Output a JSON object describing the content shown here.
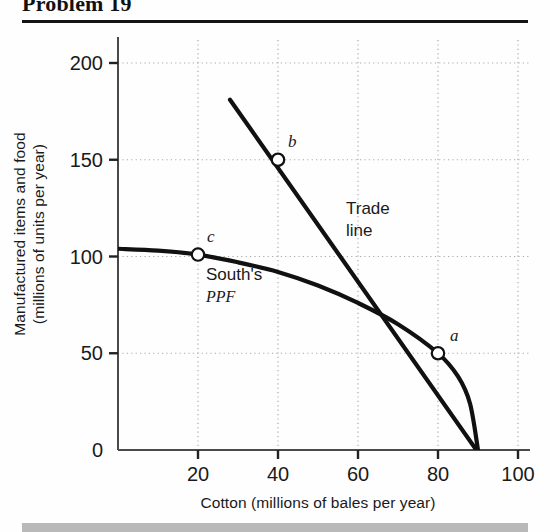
{
  "header": {
    "title": "Problem 19"
  },
  "chart_data": {
    "type": "line",
    "title": "Problem 19",
    "xlabel": "Cotton (millions of bales per year)",
    "ylabel_line1": "Manufactured items and food",
    "ylabel_line2": "(millions of units per year)",
    "xlim": [
      0,
      105
    ],
    "ylim": [
      0,
      215
    ],
    "xticks": [
      0,
      20,
      40,
      60,
      80,
      100
    ],
    "xtick_labels": [
      "0",
      "20",
      "40",
      "60",
      "80",
      "100"
    ],
    "yticks": [
      0,
      50,
      100,
      150,
      200
    ],
    "ytick_labels": [
      "0",
      "50",
      "100",
      "150",
      "200"
    ],
    "grid": "dotted",
    "legend": "none",
    "series": [
      {
        "name": "South's PPF",
        "kind": "curve",
        "points": [
          [
            0,
            104
          ],
          [
            10,
            103
          ],
          [
            20,
            101
          ],
          [
            30,
            97
          ],
          [
            40,
            92
          ],
          [
            50,
            85
          ],
          [
            60,
            76
          ],
          [
            70,
            65
          ],
          [
            80,
            50
          ],
          [
            85,
            38
          ],
          [
            88,
            24
          ],
          [
            90,
            0
          ]
        ]
      },
      {
        "name": "Trade line",
        "kind": "line",
        "points": [
          [
            28,
            181
          ],
          [
            93,
            -10
          ]
        ]
      }
    ],
    "points": [
      {
        "label": "a",
        "x": 80,
        "y": 50,
        "label_dx": 12,
        "label_dy": -12
      },
      {
        "label": "b",
        "x": 40,
        "y": 150,
        "label_dx": 10,
        "label_dy": -13
      },
      {
        "label": "c",
        "x": 20,
        "y": 101,
        "label_dx": 9,
        "label_dy": -13
      }
    ],
    "annotations": [
      {
        "name": "trade-line-label",
        "text_line1": "Trade",
        "text_line2": "line",
        "x": 57,
        "y": 122
      },
      {
        "name": "ppf-label",
        "text_line1": "South's",
        "text_line2": "PPF",
        "x": 22,
        "y": 88
      }
    ]
  },
  "colors": {
    "ink": "#1a1a1a",
    "curve": "#111111",
    "grid": "#aaaaaa",
    "axis": "#4a4a4a",
    "footer_bar": "#b9b9b9"
  }
}
